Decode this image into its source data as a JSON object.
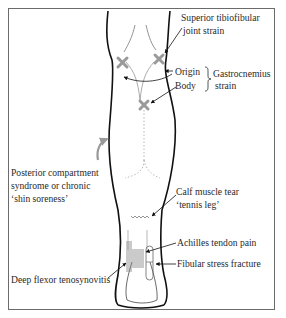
{
  "figure": {
    "frame_color": "#6b6b6b",
    "outline_color": "#111111",
    "marker_color": "#9a9a9a",
    "text_color": "#2a2a2a"
  },
  "labels": {
    "superior_tibiofibular": {
      "line1": "Superior tibiofibular",
      "line2": "joint strain"
    },
    "origin": "Origin",
    "body": "Body",
    "gastrocnemius": {
      "line1": "Gastrocnemius",
      "line2": "strain"
    },
    "posterior_compartment": {
      "line1": "Posterior compartment",
      "line2": "syndrome or chronic",
      "line3": "‘shin soreness’"
    },
    "calf_muscle_tear": {
      "line1": "Calf muscle tear",
      "line2": "‘tennis leg’"
    },
    "achilles": "Achilles tendon pain",
    "fibular_stress": "Fibular stress fracture",
    "deep_flexor": "Deep flexor tenosynovitis"
  },
  "markers": [
    {
      "name": "superior-tibiofibular-marker",
      "symbol": "x"
    },
    {
      "name": "gastrocnemius-origin-marker",
      "symbol": "x"
    },
    {
      "name": "gastrocnemius-body-marker",
      "symbol": "x"
    },
    {
      "name": "calf-tear-marker",
      "symbol": "zigzag"
    }
  ]
}
